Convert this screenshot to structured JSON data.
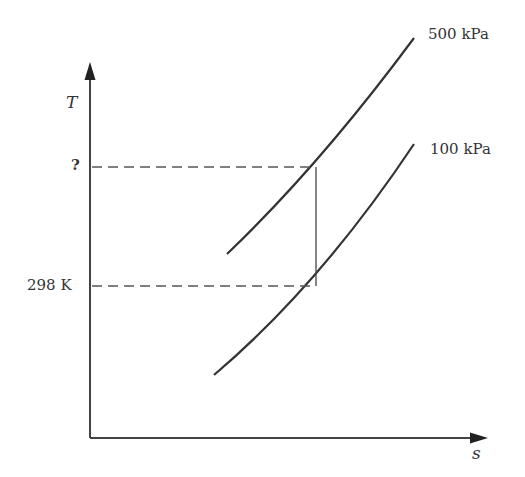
{
  "diagram": {
    "type": "T-s diagram",
    "axes": {
      "y_label": "T",
      "x_label": "s"
    },
    "isobars": [
      {
        "label": "500 kPa"
      },
      {
        "label": "100 kPa"
      }
    ],
    "temperature_marks": [
      {
        "label": "?"
      },
      {
        "label": "298 K"
      }
    ],
    "colors": {
      "line": "#333333",
      "background": "#ffffff"
    }
  }
}
